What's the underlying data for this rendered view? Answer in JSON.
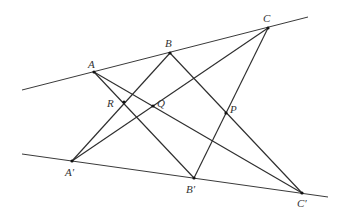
{
  "diagram": {
    "title": "",
    "lines": [
      {
        "name": "upper-line",
        "from": [
          22,
          90
        ],
        "to": [
          308,
          17
        ]
      },
      {
        "name": "lower-line",
        "from": [
          22,
          154
        ],
        "to": [
          328,
          197
        ]
      }
    ],
    "points": {
      "A": {
        "label": "A",
        "x": 94,
        "y": 72,
        "lx": 88,
        "ly": 68
      },
      "B": {
        "label": "B",
        "x": 170,
        "y": 53,
        "lx": 165,
        "ly": 47
      },
      "C": {
        "label": "C",
        "x": 268,
        "y": 28,
        "lx": 263,
        "ly": 22
      },
      "A'": {
        "label": "A′",
        "x": 72,
        "y": 161,
        "lx": 65,
        "ly": 176
      },
      "B'": {
        "label": "B′",
        "x": 194,
        "y": 178,
        "lx": 186,
        "ly": 193
      },
      "C'": {
        "label": "C′",
        "x": 302,
        "y": 193,
        "lx": 297,
        "ly": 207
      },
      "R": {
        "label": "R",
        "x": 124,
        "y": 102,
        "lx": 107,
        "ly": 107
      },
      "Q": {
        "label": "Q",
        "x": 153,
        "y": 106,
        "lx": 157,
        "ly": 107
      },
      "P": {
        "label": "P",
        "x": 226,
        "y": 113,
        "lx": 230,
        "ly": 113
      }
    },
    "segments": [
      [
        "A",
        "B'"
      ],
      [
        "A",
        "C'"
      ],
      [
        "B",
        "A'"
      ],
      [
        "B",
        "C'"
      ],
      [
        "C",
        "A'"
      ],
      [
        "C",
        "B'"
      ]
    ]
  }
}
